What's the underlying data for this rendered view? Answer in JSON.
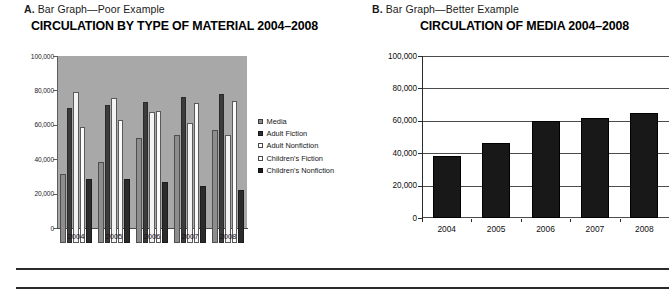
{
  "figure": {
    "panels": [
      {
        "letter": "A.",
        "caption": " Bar Graph—Poor Example",
        "title": "CIRCULATION BY TYPE OF MATERIAL 2004–2008"
      },
      {
        "letter": "B.",
        "caption": " Bar Graph—Better Example",
        "title": "CIRCULATION OF MEDIA 2004–2008"
      }
    ]
  },
  "chart_data": [
    {
      "type": "bar",
      "title": "CIRCULATION BY TYPE OF MATERIAL 2004–2008",
      "subtitle": "A. Bar Graph—Poor Example",
      "xlabel": "",
      "ylabel": "",
      "categories": [
        "2004",
        "2005",
        "2006",
        "2007",
        "2008"
      ],
      "ytick_labels": [
        "100,000",
        "80,000",
        "60,000",
        "40,000",
        "20,000",
        "0"
      ],
      "ytick_values": [
        100000,
        80000,
        60000,
        40000,
        20000,
        0
      ],
      "ylim": [
        0,
        100000
      ],
      "grid": false,
      "plot_background": "#a8a8a8",
      "legend_position": "right",
      "series": [
        {
          "name": "Media",
          "color": "#8d8d8d",
          "values": [
            40000,
            47000,
            61000,
            63000,
            65500
          ]
        },
        {
          "name": "Adult Fiction",
          "color": "#3b3b3b",
          "values": [
            78500,
            80500,
            82000,
            85000,
            86500
          ]
        },
        {
          "name": "Adult Nonfiction",
          "color": "#f4f4f4",
          "values": [
            88000,
            84500,
            76000,
            70000,
            63000
          ]
        },
        {
          "name": "Children's Fiction",
          "color": "#fbfbfb",
          "values": [
            67500,
            71500,
            76500,
            81500,
            82500
          ]
        },
        {
          "name": "Children's Nonfiction",
          "color": "#2b2b2b",
          "values": [
            37500,
            37500,
            35500,
            33000,
            31000
          ]
        }
      ]
    },
    {
      "type": "bar",
      "title": "CIRCULATION OF MEDIA 2004–2008",
      "subtitle": "B. Bar Graph—Better Example",
      "xlabel": "",
      "ylabel": "",
      "categories": [
        "2004",
        "2005",
        "2006",
        "2007",
        "2008"
      ],
      "ytick_labels": [
        "100,000",
        "80,000",
        "60,000",
        "40,000",
        "20,000",
        "0"
      ],
      "ytick_values": [
        100000,
        80000,
        60000,
        40000,
        20000,
        0
      ],
      "ylim": [
        0,
        100000
      ],
      "grid": true,
      "plot_background": "#ffffff",
      "legend_position": "none",
      "series": [
        {
          "name": "Media",
          "color": "#181818",
          "values": [
            38500,
            46000,
            60000,
            62000,
            65000
          ]
        }
      ]
    }
  ]
}
